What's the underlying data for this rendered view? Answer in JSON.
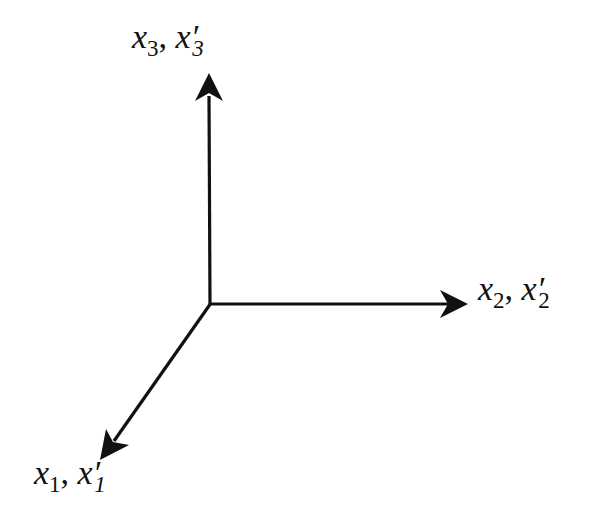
{
  "diagram": {
    "type": "coordinate-axes-3d",
    "origin": [
      210,
      304
    ],
    "line_color": "#111111",
    "axes": [
      {
        "id": "axis-3",
        "direction": "up",
        "tip": [
          209,
          73
        ],
        "label": {
          "var": "x",
          "sub": "3",
          "prime_var": "x′",
          "prime_sub": "3"
        }
      },
      {
        "id": "axis-2",
        "direction": "right",
        "tip": [
          468,
          304
        ],
        "label": {
          "var": "x",
          "sub": "2",
          "prime_var": "x′",
          "prime_sub": "2"
        }
      },
      {
        "id": "axis-1",
        "direction": "down-left",
        "tip": [
          100,
          460
        ],
        "label": {
          "var": "x",
          "sub": "1",
          "prime_var": "x′",
          "prime_sub": "1"
        }
      }
    ],
    "separator": ", "
  }
}
